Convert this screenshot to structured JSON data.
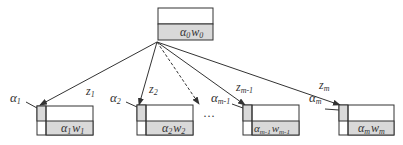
{
  "colors": {
    "line": "#333333",
    "box_fill": "#ffffff",
    "shade": "#d9d9d9",
    "text": "#333333"
  },
  "root": {
    "label_base": "α",
    "label_base_sub": "0",
    "label_w": "w",
    "label_w_sub": "0"
  },
  "children": [
    {
      "alpha": "α",
      "alpha_sub": "1",
      "z": "z",
      "z_sub": "1",
      "w": "w",
      "w_sub": "1",
      "edge": "solid"
    },
    {
      "alpha": "α",
      "alpha_sub": "2",
      "z": "z",
      "z_sub": "2",
      "w": "w",
      "w_sub": "2",
      "edge": "solid"
    },
    {
      "alpha": "α",
      "alpha_sub": "m-1",
      "z": "z",
      "z_sub": "m-1",
      "w": "w",
      "w_sub": "m-1",
      "edge": "solid"
    },
    {
      "alpha": "α",
      "alpha_sub": "m",
      "z": "z",
      "z_sub": "m",
      "w": "w",
      "w_sub": "m",
      "edge": "solid"
    }
  ],
  "ellipsis": "···"
}
